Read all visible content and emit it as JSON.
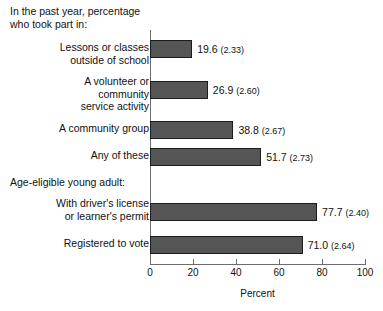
{
  "chart_data": {
    "type": "bar",
    "orientation": "horizontal",
    "title": "In the past year, percentage\nwho took part in:",
    "xlabel": "Percent",
    "ylabel": "",
    "xlim": [
      0,
      100
    ],
    "xticks": [
      0,
      20,
      40,
      60,
      80,
      100
    ],
    "xtick_labels": [
      "0",
      "20",
      "40",
      "60",
      "80",
      "100"
    ],
    "grid": false,
    "legend": null,
    "bar_color": "#555555",
    "bar_edge_color": "#1c1c1c",
    "axis_color": "#6d6d6d",
    "sections": [
      {
        "heading": "In the past year, percentage\nwho took part in:",
        "heading_position": "title"
      },
      {
        "heading": "Age-eligible young adult:",
        "heading_position": "inline"
      }
    ],
    "categories": [
      "Lessons or classes\noutside of school",
      "A volunteer or\ncommunity\nservice activity",
      "A community group",
      "Any of these",
      "With driver's license\nor learner's permit",
      "Registered to vote"
    ],
    "values": [
      19.6,
      26.9,
      38.8,
      51.7,
      77.7,
      71.0
    ],
    "standard_errors": [
      2.33,
      2.6,
      2.67,
      2.4,
      2.64,
      2.73
    ],
    "bars": [
      {
        "label": "Lessons or classes\noutside of school",
        "value": 19.6,
        "se": "2.33",
        "value_label": "19.6",
        "se_label": "(2.33)",
        "top": 40,
        "label_top": 41
      },
      {
        "label": "A volunteer or\ncommunity\nservice activity",
        "value": 26.9,
        "se": "2.60",
        "value_label": "26.9",
        "se_label": "(2.60)",
        "top": 81,
        "label_top": 75
      },
      {
        "label": "A community group",
        "value": 38.8,
        "se": "2.67",
        "value_label": "38.8",
        "se_label": "(2.67)",
        "top": 121,
        "label_top": 122
      },
      {
        "label": "Any of these",
        "value": 51.7,
        "se": "2.73",
        "value_label": "51.7",
        "se_label": "(2.73)",
        "top": 148,
        "label_top": 149
      },
      {
        "label": "With driver's license\nor learner's permit",
        "value": 77.7,
        "se": "2.40",
        "value_label": "77.7",
        "se_label": "(2.40)",
        "top": 203,
        "label_top": 197
      },
      {
        "label": "Registered to vote",
        "value": 71.0,
        "se": "2.64",
        "value_label": "71.0",
        "se_label": "(2.64)",
        "top": 236,
        "label_top": 237
      }
    ],
    "section_heading": {
      "text": "Age-eligible young adult:",
      "top": 176
    }
  }
}
